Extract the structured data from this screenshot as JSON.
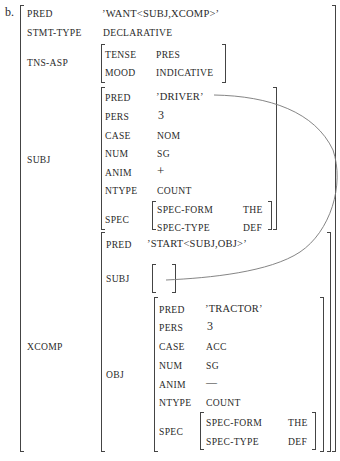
{
  "example_label": "b.",
  "fstructure": {
    "PRED": {
      "attr": "PRED",
      "value": "’WANT<SUBJ,XCOMP>’"
    },
    "STMT_TYPE": {
      "attr": "STMT-TYPE",
      "value": "DECLARATIVE"
    },
    "TNS_ASP": {
      "attr": "TNS-ASP",
      "rows": [
        {
          "attr": "TENSE",
          "value": "PRES"
        },
        {
          "attr": "MOOD",
          "value": "INDICATIVE"
        }
      ]
    },
    "SUBJ": {
      "attr": "SUBJ",
      "rows": [
        {
          "attr": "PRED",
          "value": "’DRIVER’"
        },
        {
          "attr": "PERS",
          "value": "3"
        },
        {
          "attr": "CASE",
          "value": "NOM"
        },
        {
          "attr": "NUM",
          "value": "SG"
        },
        {
          "attr": "ANIM",
          "value": "+"
        },
        {
          "attr": "NTYPE",
          "value": "COUNT"
        }
      ],
      "spec": {
        "attr": "SPEC",
        "rows": [
          {
            "attr": "SPEC-FORM",
            "value": "THE"
          },
          {
            "attr": "SPEC-TYPE",
            "value": "DEF"
          }
        ]
      }
    },
    "XCOMP": {
      "attr": "XCOMP",
      "pred": {
        "attr": "PRED",
        "value": "’START<SUBJ,OBJ>’"
      },
      "subj": {
        "attr": "SUBJ",
        "value": ""
      },
      "obj": {
        "attr": "OBJ",
        "rows": [
          {
            "attr": "PRED",
            "value": "’TRACTOR’"
          },
          {
            "attr": "PERS",
            "value": "3"
          },
          {
            "attr": "CASE",
            "value": "ACC"
          },
          {
            "attr": "NUM",
            "value": "SG"
          },
          {
            "attr": "ANIM",
            "value": "—"
          },
          {
            "attr": "NTYPE",
            "value": "COUNT"
          }
        ],
        "spec": {
          "attr": "SPEC",
          "rows": [
            {
              "attr": "SPEC-FORM",
              "value": "THE"
            },
            {
              "attr": "SPEC-TYPE",
              "value": "DEF"
            }
          ]
        }
      }
    }
  },
  "structure_sharing_link": {
    "from": "XCOMP.SUBJ",
    "to": "SUBJ.PRED",
    "style": "curved line"
  },
  "colors": {
    "text": "#2a2a2a",
    "bracket": "#444444",
    "curve": "#777777"
  }
}
